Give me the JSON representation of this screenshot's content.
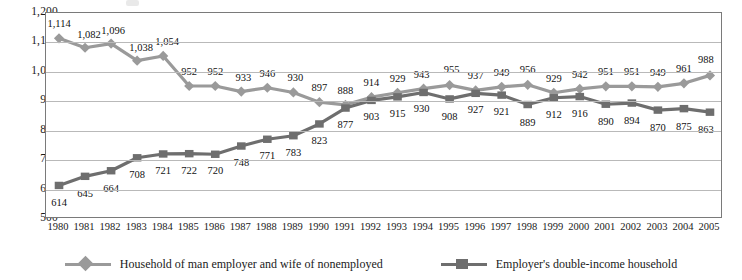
{
  "chart_data": {
    "type": "line",
    "title": "",
    "subtitle": "",
    "xlabel": "",
    "ylabel": "",
    "ylim": [
      500,
      1200
    ],
    "yticks": [
      "500",
      "600",
      "700",
      "800",
      "900",
      "1,000",
      "1,100",
      "1,200"
    ],
    "ytick_values": [
      500,
      600,
      700,
      800,
      900,
      1000,
      1100,
      1200
    ],
    "grid": true,
    "legend_position": "bottom",
    "categories": [
      "1980",
      "1981",
      "1982",
      "1983",
      "1984",
      "1985",
      "1986",
      "1987",
      "1988",
      "1989",
      "1990",
      "1991",
      "1992",
      "1993",
      "1994",
      "1995",
      "1996",
      "1997",
      "1998",
      "1999",
      "2000",
      "2001",
      "2002",
      "2003",
      "2004",
      "2005"
    ],
    "series": [
      {
        "name": "Household of man employer and wife of nonemployed",
        "marker": "diamond",
        "color": "#9a9a9a",
        "values": [
          1114,
          1082,
          1096,
          1038,
          1054,
          952,
          952,
          933,
          946,
          930,
          897,
          888,
          914,
          929,
          943,
          955,
          937,
          949,
          956,
          929,
          942,
          951,
          951,
          949,
          961,
          988
        ],
        "labels": [
          "1,114",
          "1,082",
          "1,096",
          "1,038",
          "1,054",
          "952",
          "952",
          "933",
          "946",
          "930",
          "897",
          "888",
          "914",
          "929",
          "943",
          "955",
          "937",
          "949",
          "956",
          "929",
          "942",
          "951",
          "951",
          "949",
          "961",
          "988"
        ]
      },
      {
        "name": "Employer's double-income household",
        "marker": "square",
        "color": "#6e6e6e",
        "values": [
          614,
          645,
          664,
          708,
          721,
          722,
          720,
          748,
          771,
          783,
          823,
          877,
          903,
          915,
          930,
          908,
          927,
          921,
          889,
          912,
          916,
          890,
          894,
          870,
          875,
          863
        ],
        "labels": [
          "614",
          "645",
          "664",
          "708",
          "721",
          "722",
          "720",
          "748",
          "771",
          "783",
          "823",
          "877",
          "903",
          "915",
          "930",
          "908",
          "927",
          "921",
          "889",
          "912",
          "916",
          "890",
          "894",
          "870",
          "875",
          "863"
        ]
      }
    ]
  },
  "legend": {
    "items": [
      {
        "label": "Household of man employer and wife of nonemployed",
        "color": "#9a9a9a",
        "marker": "diamond"
      },
      {
        "label": "Employer's double-income household",
        "color": "#6e6e6e",
        "marker": "square"
      }
    ]
  },
  "label_offsets": {
    "series0": [
      {
        "dx": 0,
        "dy": -15
      },
      {
        "dx": 4,
        "dy": -14
      },
      {
        "dx": 2,
        "dy": -14
      },
      {
        "dx": 4,
        "dy": -14
      },
      {
        "dx": 4,
        "dy": -15
      },
      {
        "dx": 0,
        "dy": -15
      },
      {
        "dx": 0,
        "dy": -15
      },
      {
        "dx": 2,
        "dy": -15
      },
      {
        "dx": 0,
        "dy": -15
      },
      {
        "dx": 2,
        "dy": -15
      },
      {
        "dx": 0,
        "dy": -15
      },
      {
        "dx": 0,
        "dy": -15
      },
      {
        "dx": 0,
        "dy": -15
      },
      {
        "dx": 0,
        "dy": -15
      },
      {
        "dx": -2,
        "dy": -15
      },
      {
        "dx": 2,
        "dy": -16
      },
      {
        "dx": 0,
        "dy": -15
      },
      {
        "dx": 0,
        "dy": -15
      },
      {
        "dx": 0,
        "dy": -16
      },
      {
        "dx": 0,
        "dy": -15
      },
      {
        "dx": 0,
        "dy": -15
      },
      {
        "dx": 0,
        "dy": -15
      },
      {
        "dx": 0,
        "dy": -15
      },
      {
        "dx": 0,
        "dy": -15
      },
      {
        "dx": 0,
        "dy": -15
      },
      {
        "dx": -4,
        "dy": -16
      }
    ],
    "series1": [
      {
        "dx": 0,
        "dy": 17
      },
      {
        "dx": 0,
        "dy": 17
      },
      {
        "dx": 0,
        "dy": 17
      },
      {
        "dx": 0,
        "dy": 16
      },
      {
        "dx": 0,
        "dy": 16
      },
      {
        "dx": 0,
        "dy": 16
      },
      {
        "dx": 0,
        "dy": 16
      },
      {
        "dx": 0,
        "dy": 16
      },
      {
        "dx": 0,
        "dy": 16
      },
      {
        "dx": 0,
        "dy": 16
      },
      {
        "dx": 0,
        "dy": 16
      },
      {
        "dx": 0,
        "dy": 16
      },
      {
        "dx": 0,
        "dy": 16
      },
      {
        "dx": 0,
        "dy": 16
      },
      {
        "dx": -2,
        "dy": 16
      },
      {
        "dx": 0,
        "dy": 17
      },
      {
        "dx": 0,
        "dy": 16
      },
      {
        "dx": 0,
        "dy": 16
      },
      {
        "dx": 0,
        "dy": 17
      },
      {
        "dx": 0,
        "dy": 16
      },
      {
        "dx": 0,
        "dy": 16
      },
      {
        "dx": 0,
        "dy": 17
      },
      {
        "dx": 0,
        "dy": 17
      },
      {
        "dx": 0,
        "dy": 17
      },
      {
        "dx": 0,
        "dy": 17
      },
      {
        "dx": -4,
        "dy": 17
      }
    ]
  }
}
